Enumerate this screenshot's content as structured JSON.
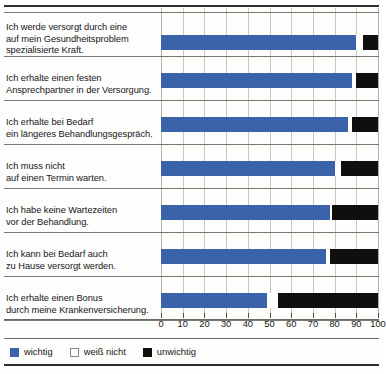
{
  "chart_data": {
    "type": "bar",
    "orientation": "horizontal",
    "stacked": true,
    "title": "",
    "subtitle": "",
    "xlabel": "",
    "ylabel": "",
    "xlim": [
      0,
      100
    ],
    "xticks": [
      0,
      10,
      20,
      30,
      40,
      50,
      60,
      70,
      80,
      90,
      100
    ],
    "xticklabels": [
      "0",
      "10",
      "20",
      "30",
      "40",
      "50",
      "60",
      "70",
      "80",
      "90",
      "100"
    ],
    "grid": true,
    "grid_axis": "x",
    "legend_position": "bottom-left",
    "categories": [
      "Ich werde versorgt durch eine auf mein Gesundheitsproblem spezialisierte Kraft.",
      "Ich erhalte einen festen Ansprechpartner in der Versorgung.",
      "Ich erhalte bei Bedarf ein längeres Behandlungsgespräch.",
      "Ich muss nicht auf einen Termin warten.",
      "Ich habe keine Wartezeiten vor der Behandlung.",
      "Ich kann bei Bedarf auch zu Hause versorgt werden.",
      "Ich erhalte einen Bonus durch meine Krankenversicherung."
    ],
    "category_lines": [
      [
        "Ich werde versorgt durch eine",
        "auf mein Gesundheitsproblem",
        "spezialisierte Kraft."
      ],
      [
        "Ich erhalte einen festen",
        "Ansprechpartner in der Versorgung."
      ],
      [
        "Ich erhalte bei Bedarf",
        "ein längeres Behandlungsgespräch."
      ],
      [
        "Ich muss nicht",
        "auf einen Termin warten."
      ],
      [
        "Ich habe keine Wartezeiten",
        "vor der Behandlung."
      ],
      [
        "Ich kann bei Bedarf auch",
        "zu Hause versorgt werden."
      ],
      [
        "Ich erhalte einen Bonus",
        "durch meine Krankenversicherung."
      ]
    ],
    "series": [
      {
        "name": "wichtig",
        "color": "#3b63ac",
        "values": [
          90,
          88,
          86,
          80,
          78,
          76,
          49
        ]
      },
      {
        "name": "weiß nicht",
        "color": "#ffffff",
        "values": [
          3,
          2,
          2,
          3,
          1,
          2,
          5
        ]
      },
      {
        "name": "unwichtig",
        "color": "#100f0d",
        "values": [
          7,
          10,
          12,
          17,
          21,
          22,
          46
        ]
      }
    ]
  },
  "legend": {
    "items": [
      {
        "label": "wichtig",
        "swatch": "wichtig",
        "color": "#3b63ac"
      },
      {
        "label": "weiß nicht",
        "swatch": "weiss",
        "color": "#ffffff"
      },
      {
        "label": "unwichtig",
        "swatch": "unwichtig",
        "color": "#100f0d"
      }
    ]
  }
}
